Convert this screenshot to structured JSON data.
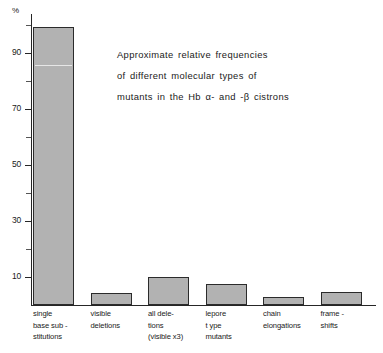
{
  "chart_data": {
    "type": "bar",
    "title": "Approximate relative frequencies of different molecular types of mutants in the Hb α- and -β cistrons",
    "title_lines": [
      "Approximate  relative  frequencies",
      "of  different  molecular  types  of",
      "mutants  in  the   Hb α-  and -β cistrons"
    ],
    "xlabel": "",
    "ylabel": "%",
    "y_unit": "%",
    "ylim": [
      0,
      104
    ],
    "grid": false,
    "legend": "none",
    "y_ticks_major": [
      10,
      30,
      50,
      70,
      90
    ],
    "y_tick_labels": [
      "10",
      "30",
      "50",
      "70",
      "90"
    ],
    "y_ticks_minor": [
      20,
      40,
      60,
      80,
      100
    ],
    "categories": [
      "single base sub-stitutions",
      "visible deletions",
      "all dele-tions (visible x3)",
      "lepore type mutants",
      "chain elongations",
      "frame-shifts"
    ],
    "category_label_lines": [
      [
        "single",
        "base sub -",
        "stitutions"
      ],
      [
        "visible",
        "deletions"
      ],
      [
        "all dele-",
        "tions",
        "(visible x3)"
      ],
      [
        "lepore",
        "t ype",
        "mutants"
      ],
      [
        "chain",
        "elongations"
      ],
      [
        "frame -",
        "shifts"
      ]
    ],
    "values": [
      99.5,
      4.2,
      10,
      7.5,
      3,
      4.5
    ],
    "bar_color": "#b2b2b2",
    "bar_edge_color": "#2b2b2b",
    "annotations": [
      {
        "label": "scan-line artifact in first bar",
        "y": 85
      }
    ]
  }
}
